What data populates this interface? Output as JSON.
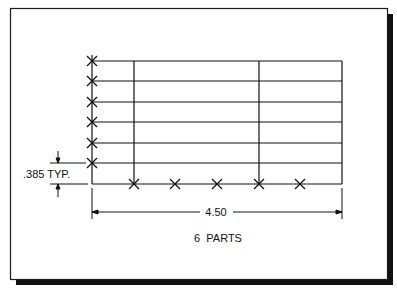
{
  "drawing": {
    "frame": {
      "border_color": "#1a1a1a",
      "shadow_color": "#111111",
      "background": "#ffffff"
    },
    "grid": {
      "rows": 6,
      "left_x": 92,
      "right_x": 342,
      "row_y": [
        61,
        81,
        102,
        122,
        143,
        163,
        184
      ],
      "interior_verticals_x": [
        134,
        259
      ]
    },
    "marks": {
      "left_column_x_marks_y": [
        61,
        81,
        102,
        122,
        143,
        163
      ],
      "bottom_row_x_marks_x": [
        134,
        175,
        217,
        259,
        300
      ]
    },
    "vertical_dimension": {
      "value": ".385 TYP."
    },
    "horizontal_dimension": {
      "value": "4.50"
    },
    "note": "6  PARTS"
  }
}
